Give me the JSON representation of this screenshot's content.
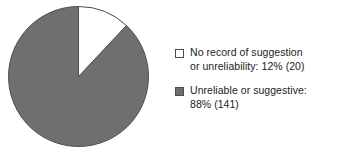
{
  "chart_data": {
    "type": "pie",
    "title": "",
    "subtitle": "",
    "xlabel": "",
    "ylabel": "",
    "grid": false,
    "legend_position": "right",
    "start_angle_deg": 0,
    "direction": "clockwise",
    "categories": [
      "No record of suggestion or unreliability",
      "Unreliable or suggestive"
    ],
    "values": [
      12,
      88
    ],
    "counts": [
      20,
      141
    ],
    "total_count": 161,
    "units": "percent",
    "slices": [
      {
        "label": "No record of suggestion or unreliability",
        "percent": 12,
        "count": 20,
        "percent_label": "12%",
        "count_label": "(20)",
        "color": "#ffffff",
        "edge_color": "#4d4d4d",
        "start_angle_deg": 0,
        "end_angle_deg": 43.2
      },
      {
        "label": "Unreliable or suggestive",
        "percent": 88,
        "count": 141,
        "percent_label": "88%",
        "count_label": "(141)",
        "color": "#706f70",
        "edge_color": "#4d4d4d",
        "start_angle_deg": 43.2,
        "end_angle_deg": 360
      }
    ]
  },
  "legend": {
    "entries": [
      {
        "swatch_name": "legend-swatch-no-record",
        "text": "No record of suggestion\nor unreliability: 12% (20)",
        "color": "#ffffff"
      },
      {
        "swatch_name": "legend-swatch-unreliable",
        "text": "Unreliable or suggestive:\n88% (141)",
        "color": "#706f70"
      }
    ]
  },
  "colors": {
    "slice_white": "#ffffff",
    "slice_gray": "#706f70",
    "outline": "#4d4d4d",
    "text": "#1c1c1c",
    "background": "#ffffff"
  }
}
